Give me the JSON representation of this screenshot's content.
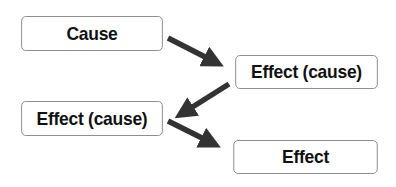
{
  "diagram": {
    "type": "cause-effect chain",
    "nodes": [
      {
        "id": "node-1",
        "label": "Cause"
      },
      {
        "id": "node-2",
        "label": "Effect (cause)"
      },
      {
        "id": "node-3",
        "label": "Effect (cause)"
      },
      {
        "id": "node-4",
        "label": "Effect"
      }
    ],
    "edges": [
      {
        "from": "node-1",
        "to": "node-2"
      },
      {
        "from": "node-2",
        "to": "node-3"
      },
      {
        "from": "node-3",
        "to": "node-4"
      }
    ],
    "colors": {
      "arrow": "#333333",
      "border": "#8a8a8a",
      "text": "#111111",
      "background": "#ffffff"
    }
  }
}
